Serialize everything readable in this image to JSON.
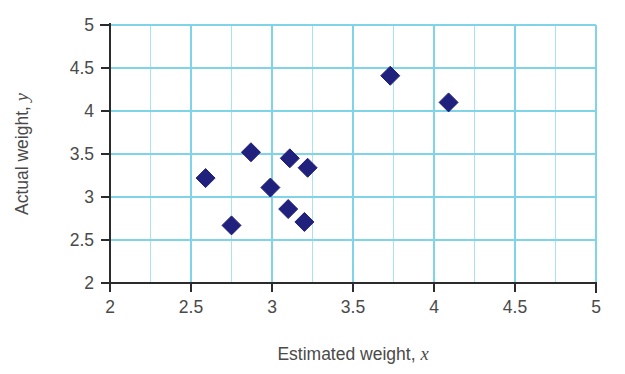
{
  "chart_data": {
    "type": "scatter",
    "title": "",
    "xlabel": "Estimated weight, x",
    "ylabel": "Actual weight, y",
    "xlabel_text": "Estimated weight,",
    "xlabel_var": "x",
    "ylabel_text": "Actual weight,",
    "ylabel_var": "y",
    "xlim": [
      2,
      5
    ],
    "ylim": [
      2,
      5
    ],
    "x_ticks": [
      2,
      2.5,
      3,
      3.5,
      4,
      4.5,
      5
    ],
    "y_ticks": [
      2,
      2.5,
      3,
      3.5,
      4,
      4.5,
      5
    ],
    "x_tick_labels": [
      "2",
      "2.5",
      "3",
      "3.5",
      "4",
      "4.5",
      "5"
    ],
    "y_tick_labels": [
      "2",
      "2.5",
      "3",
      "3.5",
      "4",
      "4.5",
      "5"
    ],
    "x_gridline_step": 0.25,
    "y_gridline_step": 0.5,
    "grid": true,
    "grid_color": "#7fd4e8",
    "marker_color": "#20207d",
    "marker_shape": "diamond",
    "legend": null,
    "points": [
      {
        "x": 2.59,
        "y": 3.22
      },
      {
        "x": 2.75,
        "y": 2.67
      },
      {
        "x": 2.87,
        "y": 3.52
      },
      {
        "x": 2.99,
        "y": 3.11
      },
      {
        "x": 3.1,
        "y": 2.86
      },
      {
        "x": 3.11,
        "y": 3.45
      },
      {
        "x": 3.2,
        "y": 2.71
      },
      {
        "x": 3.22,
        "y": 3.34
      },
      {
        "x": 3.73,
        "y": 4.41
      },
      {
        "x": 4.09,
        "y": 4.1
      }
    ]
  }
}
